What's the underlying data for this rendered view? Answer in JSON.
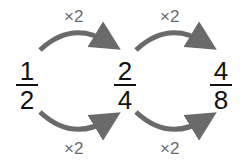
{
  "fractions": [
    {
      "numerator": "1",
      "denominator": "2"
    },
    {
      "numerator": "2",
      "denominator": "4"
    },
    {
      "numerator": "4",
      "denominator": "8"
    }
  ],
  "arrows": {
    "top": [
      {
        "label": "×2"
      },
      {
        "label": "×2"
      }
    ],
    "bottom": [
      {
        "label": "×2"
      },
      {
        "label": "×2"
      }
    ]
  },
  "colors": {
    "arrow": "#6a6a6a",
    "text": "#111111"
  }
}
